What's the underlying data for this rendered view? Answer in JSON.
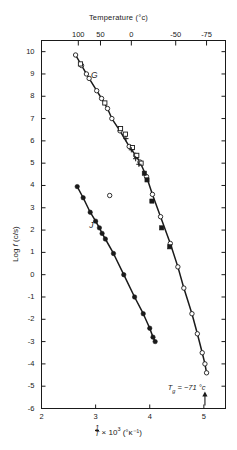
{
  "chart_data": {
    "type": "scatter",
    "title": "Temperature (°c)",
    "xlabel_parts": {
      "frac_num": "1",
      "frac_den": "T",
      "times": "× 10",
      "exp": "3",
      "unit": "(°κ⁻¹)"
    },
    "ylabel": "Log f (c/s)",
    "xlim": [
      2,
      5.4
    ],
    "ylim": [
      -6,
      10.5
    ],
    "grid": false,
    "legend_position": "none",
    "x_ticks": [
      "2",
      "3",
      "4",
      "5"
    ],
    "x_tick_values": [
      2,
      3,
      4,
      5
    ],
    "y_ticks": [
      "10",
      "9",
      "8",
      "7",
      "6",
      "5",
      "4",
      "3",
      "2",
      "1",
      "0",
      "-1",
      "-2",
      "-3",
      "-4",
      "-5",
      "-6"
    ],
    "y_tick_values": [
      10,
      9,
      8,
      7,
      6,
      5,
      4,
      3,
      2,
      1,
      0,
      -1,
      -2,
      -3,
      -4,
      -5,
      -6
    ],
    "top_axis_label": "Temperature (°c)",
    "top_ticks": [
      "100",
      "50",
      "0",
      "-50",
      "-75"
    ],
    "top_tick_values": [
      100,
      50,
      0,
      -50,
      -75
    ],
    "top_tick_x": [
      2.68,
      3.09,
      3.66,
      4.48,
      5.05
    ],
    "annotations": [
      {
        "name": "tg-label",
        "text": "T₉ = -71 °c",
        "x": 4.72,
        "y": -5.1
      },
      {
        "name": "curve-label-g",
        "text": "G",
        "x": 2.95,
        "y": 8.95
      },
      {
        "name": "curve-label-j",
        "text": "J",
        "x": 2.92,
        "y": 2.25
      }
    ],
    "series": [
      {
        "name": "G",
        "marker": "open-circle",
        "line": true,
        "points": [
          {
            "x": 2.63,
            "y": 9.85
          },
          {
            "x": 2.74,
            "y": 9.38
          },
          {
            "x": 2.83,
            "y": 9.0
          },
          {
            "x": 2.88,
            "y": 8.8
          },
          {
            "x": 3.02,
            "y": 8.25
          },
          {
            "x": 3.11,
            "y": 7.9
          },
          {
            "x": 3.22,
            "y": 7.45
          },
          {
            "x": 3.3,
            "y": 7.0
          },
          {
            "x": 3.45,
            "y": 6.45
          },
          {
            "x": 3.62,
            "y": 5.75
          },
          {
            "x": 3.74,
            "y": 5.35
          },
          {
            "x": 3.82,
            "y": 5.05
          },
          {
            "x": 3.94,
            "y": 4.4
          },
          {
            "x": 4.05,
            "y": 3.6
          },
          {
            "x": 4.2,
            "y": 2.6
          },
          {
            "x": 4.38,
            "y": 1.4
          },
          {
            "x": 4.52,
            "y": 0.35
          },
          {
            "x": 4.63,
            "y": -0.6
          },
          {
            "x": 4.78,
            "y": -1.75
          },
          {
            "x": 4.88,
            "y": -2.65
          },
          {
            "x": 4.97,
            "y": -3.5
          },
          {
            "x": 5.02,
            "y": -4.0
          },
          {
            "x": 5.05,
            "y": -4.4
          }
        ]
      },
      {
        "name": "G-squares",
        "marker": "open-square",
        "line": false,
        "points": [
          {
            "x": 2.72,
            "y": 9.45
          },
          {
            "x": 3.17,
            "y": 7.7
          },
          {
            "x": 3.46,
            "y": 6.55
          },
          {
            "x": 3.55,
            "y": 6.3
          },
          {
            "x": 3.68,
            "y": 5.7
          },
          {
            "x": 3.76,
            "y": 5.35
          },
          {
            "x": 3.84,
            "y": 5.0
          }
        ]
      },
      {
        "name": "G-crosses",
        "marker": "plus",
        "line": false,
        "points": [
          {
            "x": 3.56,
            "y": 6.1
          },
          {
            "x": 3.66,
            "y": 5.6
          },
          {
            "x": 3.74,
            "y": 5.2
          },
          {
            "x": 3.8,
            "y": 4.95
          }
        ]
      },
      {
        "name": "filled-squares",
        "marker": "filled-square",
        "line": false,
        "points": [
          {
            "x": 3.9,
            "y": 4.55
          },
          {
            "x": 3.95,
            "y": 4.25
          },
          {
            "x": 4.04,
            "y": 3.3
          },
          {
            "x": 4.22,
            "y": 2.1
          },
          {
            "x": 4.37,
            "y": 1.25
          }
        ]
      },
      {
        "name": "isolated-open-circle",
        "marker": "open-circle",
        "line": false,
        "points": [
          {
            "x": 3.26,
            "y": 3.55
          }
        ]
      },
      {
        "name": "J",
        "marker": "filled-circle",
        "line": true,
        "points": [
          {
            "x": 2.66,
            "y": 3.95
          },
          {
            "x": 2.77,
            "y": 3.45
          },
          {
            "x": 2.9,
            "y": 2.8
          },
          {
            "x": 3.0,
            "y": 2.4
          },
          {
            "x": 3.07,
            "y": 2.1
          },
          {
            "x": 3.12,
            "y": 1.85
          },
          {
            "x": 3.18,
            "y": 1.6
          },
          {
            "x": 3.33,
            "y": 0.95
          },
          {
            "x": 3.52,
            "y": 0.0
          },
          {
            "x": 3.72,
            "y": -1.0
          },
          {
            "x": 3.88,
            "y": -1.75
          },
          {
            "x": 4.0,
            "y": -2.4
          },
          {
            "x": 4.06,
            "y": -2.8
          },
          {
            "x": 4.1,
            "y": -3.0
          }
        ]
      }
    ]
  }
}
